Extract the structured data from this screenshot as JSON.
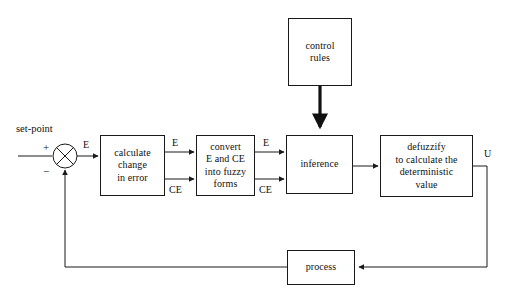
{
  "diagram": {
    "canvas": {
      "width": 509,
      "height": 295,
      "background": "#ffffff"
    },
    "stroke_color": "#1a1a1a",
    "text_color": "#101010",
    "nodes": {
      "control_rules": {
        "label": "control\nrules",
        "x": 288,
        "y": 18,
        "w": 64,
        "h": 68
      },
      "calculate_change": {
        "label": "calculate\nchange\nin error",
        "x": 100,
        "y": 135,
        "w": 65,
        "h": 61
      },
      "convert_fuzzy": {
        "label": "convert\nE and CE\ninto fuzzy\nforms",
        "x": 196,
        "y": 135,
        "w": 59,
        "h": 61
      },
      "inference": {
        "label": "inference",
        "x": 286,
        "y": 135,
        "w": 67,
        "h": 59
      },
      "defuzzify": {
        "label": "defuzzify\nto calculate the\ndeterministic\nvalue",
        "x": 380,
        "y": 135,
        "w": 93,
        "h": 62
      },
      "process": {
        "label": "process",
        "x": 287,
        "y": 250,
        "w": 68,
        "h": 35
      }
    },
    "summing_junction": {
      "name": "summing-junction",
      "cx": 65,
      "cy": 156,
      "r": 12,
      "plus_label": "+",
      "minus_label": "−"
    },
    "labels": {
      "set_point": "set-point",
      "error_out": "E",
      "e_mid_left": "E",
      "ce_mid_left": "CE",
      "e_mid_right": "E",
      "ce_mid_right": "CE",
      "u_output": "U"
    },
    "signals": [
      {
        "name": "set-point-input",
        "from": "external",
        "to": "summing-junction",
        "label": "set-point"
      },
      {
        "name": "error-signal",
        "from": "summing-junction",
        "to": "calculate-change-box",
        "label": "E"
      },
      {
        "name": "e-signal-1",
        "from": "calculate-change-box",
        "to": "convert-fuzzy-box",
        "label": "E"
      },
      {
        "name": "ce-signal-1",
        "from": "calculate-change-box",
        "to": "convert-fuzzy-box",
        "label": "CE"
      },
      {
        "name": "e-signal-2",
        "from": "convert-fuzzy-box",
        "to": "inference-box",
        "label": "E"
      },
      {
        "name": "ce-signal-2",
        "from": "convert-fuzzy-box",
        "to": "inference-box",
        "label": "CE"
      },
      {
        "name": "rules-signal",
        "from": "control-rules-box",
        "to": "inference-box",
        "label": "",
        "style": "thick"
      },
      {
        "name": "inference-output",
        "from": "inference-box",
        "to": "defuzzify-box",
        "label": ""
      },
      {
        "name": "control-output",
        "from": "defuzzify-box",
        "to": "process-box",
        "label": "U"
      },
      {
        "name": "feedback-signal",
        "from": "process-box",
        "to": "summing-junction",
        "label": ""
      }
    ]
  }
}
